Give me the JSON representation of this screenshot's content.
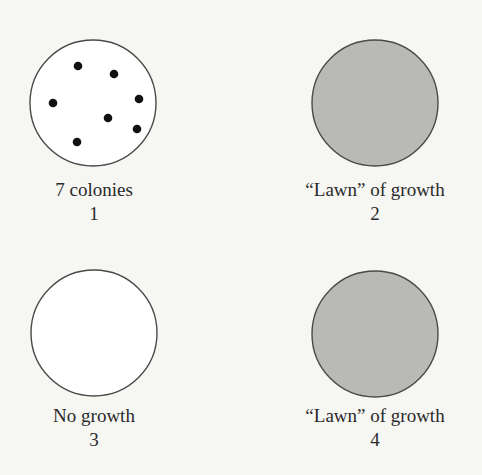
{
  "figure": {
    "colors": {
      "background": "#f6f6f3",
      "outline": "#4a4a4a",
      "lawn_fill": "#b9b9b6",
      "empty_fill": "#ffffff",
      "colony": "#111111"
    },
    "plates": [
      {
        "id": 1,
        "caption": "7 colonies",
        "number": "1",
        "fill": "empty",
        "colony_count": 7
      },
      {
        "id": 2,
        "caption": "“Lawn” of growth",
        "number": "2",
        "fill": "lawn"
      },
      {
        "id": 3,
        "caption": "No growth",
        "number": "3",
        "fill": "empty"
      },
      {
        "id": 4,
        "caption": "“Lawn” of growth",
        "number": "4",
        "fill": "lawn"
      }
    ]
  }
}
